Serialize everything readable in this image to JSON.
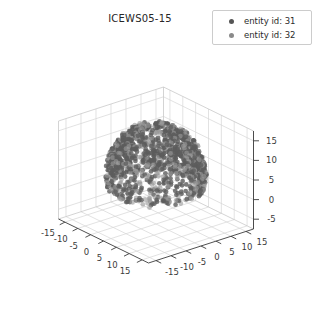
{
  "figure": {
    "title": "ICEWS05-15",
    "background_color": "#ffffff",
    "width": 319,
    "height": 324
  },
  "legend": {
    "position": "upper-right",
    "entries": [
      {
        "label": "entity id: 31",
        "marker": "circle-marker",
        "color": "#555555"
      },
      {
        "label": "entity id: 32",
        "marker": "circle-marker",
        "color": "#8a8a8a"
      }
    ]
  },
  "chart_data": {
    "type": "scatter",
    "projection": "3d",
    "title": "ICEWS05-15",
    "xlabel": "",
    "ylabel": "",
    "zlabel": "",
    "grid": true,
    "legend_position": "upper right",
    "xlim": [
      -17.5,
      17.5
    ],
    "ylim": [
      -17.5,
      17.5
    ],
    "zlim": [
      -7.5,
      17.5
    ],
    "xticks": [
      -15,
      -10,
      -5,
      0,
      5,
      10,
      15
    ],
    "yticks": [
      -15,
      -10,
      -5,
      0,
      5,
      10,
      15
    ],
    "zticks": [
      -5,
      0,
      5,
      10,
      15
    ],
    "xticklabels": [
      "-15",
      "-10",
      "-5",
      "0",
      "5",
      "10",
      "15"
    ],
    "yticklabels": [
      "-15",
      "-10",
      "-5",
      "0",
      "5",
      "10",
      "15"
    ],
    "zticklabels": [
      "-5",
      "0",
      "5",
      "10",
      "15"
    ],
    "series": [
      {
        "name": "entity id: 31",
        "color": "#5d5d5d",
        "marker": "o",
        "point_count": 900,
        "shape": "spherical-shell",
        "center": [
          0,
          0,
          5
        ],
        "radius": 12.5,
        "description": "Dense hemispherical shell of points, denser toward upper hemisphere"
      },
      {
        "name": "entity id: 32",
        "color": "#9a9a9a",
        "marker": "o",
        "point_count": 500,
        "shape": "spherical-shell",
        "center": [
          0,
          0,
          5
        ],
        "radius": 12.5,
        "description": "Lighter gray points interleaved within the same spherical shell"
      }
    ]
  },
  "colors": {
    "grid_line": "#d6d6d6",
    "axis_line": "#3c3c3c",
    "tick_text": "#3a3a3a",
    "title_text": "#262626",
    "legend_border": "#cccccc"
  }
}
